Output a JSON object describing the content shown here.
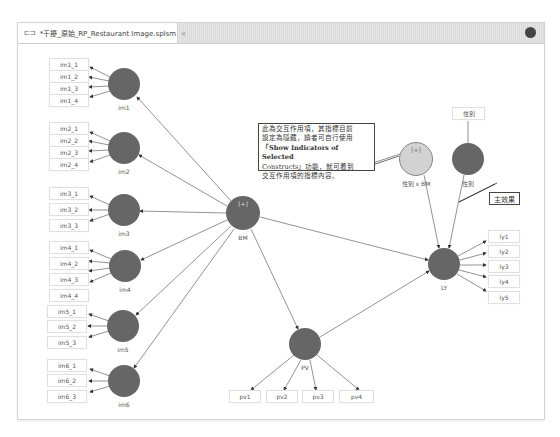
{
  "editor": {
    "tab": {
      "icon": "model-file-icon",
      "title": "*干擾_原始_RP_Restaurant Image.splsm",
      "close_glyph": "✕"
    },
    "view_menu_icon": "view-menu-icon"
  },
  "diagram": {
    "colors": {
      "construct_fill": "#666666",
      "interaction_fill": "#d0d0d0",
      "arrow": "#777777",
      "indicator_border": "#e0e0e0"
    },
    "constructs": [
      {
        "id": "im1",
        "label": "im1",
        "indicators": [
          "im1_1",
          "im1_2",
          "im1_3",
          "im1_4"
        ]
      },
      {
        "id": "im2",
        "label": "im2",
        "indicators": [
          "im2_1",
          "im2_2",
          "im2_3",
          "im2_4"
        ]
      },
      {
        "id": "im3",
        "label": "im3",
        "indicators": [
          "im3_1",
          "im3_2",
          "im3_3"
        ]
      },
      {
        "id": "im4",
        "label": "im4",
        "indicators": [
          "im4_1",
          "im4_2",
          "im4_3",
          "im4_4"
        ]
      },
      {
        "id": "im5",
        "label": "im5",
        "indicators": [
          "im5_1",
          "im5_2",
          "im5_3"
        ]
      },
      {
        "id": "im6",
        "label": "im6",
        "indicators": [
          "im6_1",
          "im6_2",
          "im6_3"
        ]
      },
      {
        "id": "BM",
        "label": "BM",
        "marker": "[+]"
      },
      {
        "id": "PV",
        "label": "PV",
        "indicators": [
          "pv1",
          "pv2",
          "pv3",
          "pv4"
        ]
      },
      {
        "id": "LY",
        "label": "LY",
        "indicators": [
          "ly1",
          "ly2",
          "ly3",
          "ly4",
          "ly5"
        ]
      },
      {
        "id": "gender",
        "label": "性別",
        "indicators": [
          "性別"
        ]
      },
      {
        "id": "interaction",
        "label": "性別 x BM",
        "marker": "[+]"
      }
    ],
    "paths": [
      [
        "BM",
        "im1"
      ],
      [
        "BM",
        "im2"
      ],
      [
        "BM",
        "im3"
      ],
      [
        "BM",
        "im4"
      ],
      [
        "BM",
        "im5"
      ],
      [
        "BM",
        "im6"
      ],
      [
        "BM",
        "LY"
      ],
      [
        "BM",
        "PV"
      ],
      [
        "PV",
        "LY"
      ],
      [
        "interaction",
        "LY"
      ],
      [
        "gender",
        "LY"
      ]
    ],
    "annotations": {
      "note_line1": "此為交互作用項，其指標目前",
      "note_line2": "設定為隱藏，讀者可自行使用",
      "note_line3": "「Show Indicators of Selected",
      "note_line4": "Constructs」功能，就可看到",
      "note_line5": "交互作用項的指標內容。",
      "main_effect": "主效果"
    }
  }
}
